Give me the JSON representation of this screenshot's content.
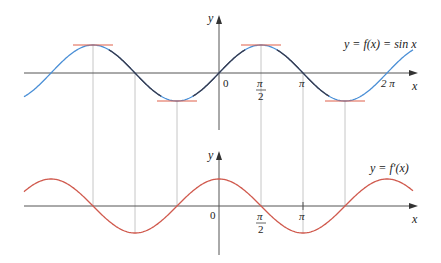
{
  "chart_data": [
    {
      "type": "line",
      "title": "",
      "series": [
        {
          "name": "y = f(x) = sin x",
          "function": "sin",
          "color": "#4a8fd6"
        }
      ],
      "xlabel": "x",
      "ylabel": "y",
      "xlim": [
        -4.5,
        5.0
      ],
      "ylim": [
        -1,
        1
      ],
      "x_ticks": [
        {
          "value": 0,
          "label": "0"
        },
        {
          "value": 1.5708,
          "label_num": "π",
          "label_den": "2"
        },
        {
          "value": 3.1416,
          "label": "π"
        },
        {
          "value": 6.2832,
          "label": "2 π"
        }
      ],
      "horizontal_tangents_at": [
        -4.7124,
        -1.5708,
        1.5708,
        4.7124
      ],
      "tangent_color": "#e0604a",
      "grid": false,
      "legend": "inline label at upper right"
    },
    {
      "type": "line",
      "title": "",
      "series": [
        {
          "name": "y = f′(x)",
          "function": "cos",
          "color": "#d05a4e"
        }
      ],
      "xlabel": "x",
      "ylabel": "y",
      "xlim": [
        -4.5,
        5.0
      ],
      "ylim": [
        -1,
        1
      ],
      "x_ticks": [
        {
          "value": 0,
          "label": "0"
        },
        {
          "value": 1.5708,
          "label_num": "π",
          "label_den": "2"
        },
        {
          "value": 3.1416,
          "label": "π"
        }
      ],
      "zeros_at": [
        -4.7124,
        -1.5708,
        1.5708,
        4.7124
      ],
      "grid": false,
      "legend": "inline label at upper right"
    }
  ],
  "labels": {
    "top_curve": "y = f(x) = sin x",
    "bottom_curve": "y = f′(x)",
    "y_axis": "y",
    "x_axis": "x",
    "origin": "0",
    "pi": "π",
    "two": "2",
    "two_pi": "2 π"
  },
  "colors": {
    "sin": "#4a8fd6",
    "sin_dark": "#3a3a4a",
    "cos": "#d05a4e",
    "tangent": "#e0604a",
    "axis": "#555555",
    "guide": "#b8b8b8"
  }
}
